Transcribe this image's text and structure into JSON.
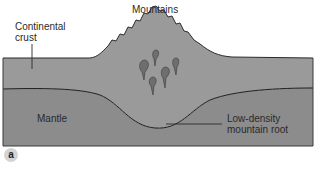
{
  "diagram": {
    "labels": {
      "mountains": "Mountains",
      "continental_crust_line1": "Continental",
      "continental_crust_line2": "crust",
      "mantle": "Mantle",
      "root_line1": "Low-density",
      "root_line2": "mountain root"
    },
    "panel_badge": "a",
    "colors": {
      "crust": "#9a9a9a",
      "mantle": "#8c8c8c",
      "magma": "#6e6e6e",
      "outline": "#2b2b2b",
      "badge": "#d4d4d4"
    }
  }
}
